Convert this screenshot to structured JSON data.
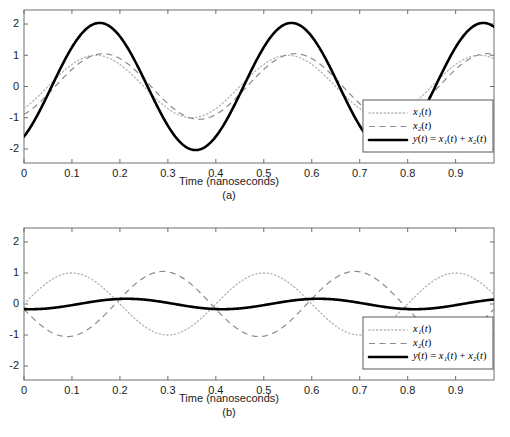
{
  "figure": {
    "panels": [
      {
        "id": "a",
        "caption": "(a)",
        "xlabel": "Time (nanoseconds)",
        "ylabel": "",
        "xticks": [
          "0",
          "0.1",
          "0.2",
          "0.3",
          "0.4",
          "0.5",
          "0.6",
          "0.7",
          "0.8",
          "0.9"
        ],
        "xtick_values": [
          0,
          0.1,
          0.2,
          0.3,
          0.4,
          0.5,
          0.6,
          0.7,
          0.8,
          0.9
        ],
        "yticks": [
          "2",
          "1",
          "0",
          "-1",
          "-2"
        ],
        "ytick_values": [
          2,
          1,
          0,
          -1,
          -2
        ],
        "xlim": [
          0,
          0.98
        ],
        "ylim": [
          -2.45,
          2.45
        ],
        "legend": [
          {
            "label": "x₁(t)",
            "style": "dotted",
            "series": "x1"
          },
          {
            "label": "x₂(t)",
            "style": "dashed",
            "series": "x2"
          },
          {
            "label": "y(t) = x₁(t) + x₂(t)",
            "style": "solid",
            "series": "y"
          }
        ],
        "series": [
          {
            "name": "x1",
            "amplitude": 1.0,
            "period": 0.4,
            "phase_ns": 0.15,
            "offset": 0.0,
            "style": "dotted"
          },
          {
            "name": "x2",
            "amplitude": 1.05,
            "period": 0.4,
            "phase_ns": 0.165,
            "offset": 0.0,
            "style": "dashed"
          },
          {
            "name": "y",
            "amplitude": 0.0,
            "period": 0.4,
            "phase_ns": 0.0,
            "offset": 0.0,
            "style": "solid",
            "is_sum": true
          }
        ]
      },
      {
        "id": "b",
        "caption": "(b)",
        "xlabel": "Time (nanoseconds)",
        "ylabel": "",
        "xticks": [
          "0",
          "0.1",
          "0.2",
          "0.3",
          "0.4",
          "0.5",
          "0.6",
          "0.7",
          "0.8",
          "0.9"
        ],
        "xtick_values": [
          0,
          0.1,
          0.2,
          0.3,
          0.4,
          0.5,
          0.6,
          0.7,
          0.8,
          0.9
        ],
        "yticks": [
          "2",
          "1",
          "0",
          "-1",
          "-2"
        ],
        "ytick_values": [
          2,
          1,
          0,
          -1,
          -2
        ],
        "xlim": [
          0,
          0.98
        ],
        "ylim": [
          -2.45,
          2.45
        ],
        "legend": [
          {
            "label": "x₁(t)",
            "style": "dotted",
            "series": "x1"
          },
          {
            "label": "x₂(t)",
            "style": "dashed",
            "series": "x2"
          },
          {
            "label": "y(t) = x₁(t) + x₂(t)",
            "style": "solid",
            "series": "y"
          }
        ],
        "series": [
          {
            "name": "x1",
            "amplitude": 1.0,
            "period": 0.4,
            "phase_ns": 0.1,
            "offset": 0.0,
            "style": "dotted"
          },
          {
            "name": "x2",
            "amplitude": 1.05,
            "period": 0.4,
            "phase_ns": 0.29,
            "offset": 0.0,
            "style": "dashed"
          },
          {
            "name": "y",
            "amplitude": 0.0,
            "period": 0.4,
            "phase_ns": 0.0,
            "offset": 0.0,
            "style": "solid",
            "is_sum": true
          }
        ]
      }
    ]
  },
  "chart_data": [
    {
      "type": "line",
      "panel": "(a)",
      "title": "",
      "xlabel": "Time (nanoseconds)",
      "ylabel": "",
      "xlim": [
        0,
        0.98
      ],
      "ylim": [
        -2.45,
        2.45
      ],
      "xticks": [
        0,
        0.1,
        0.2,
        0.3,
        0.4,
        0.5,
        0.6,
        0.7,
        0.8,
        0.9
      ],
      "yticks": [
        2,
        1,
        0,
        -1,
        -2
      ],
      "grid": false,
      "legend_position": "lower right",
      "description": "Constructive interference: two nearly in-phase sinusoids sum to roughly double amplitude.",
      "series": [
        {
          "name": "x1(t)",
          "style": "dotted",
          "color": "#b4b4b4",
          "amplitude": 1.0,
          "period_ns": 0.4,
          "peak_times_ns": [
            0.15,
            0.55,
            0.95
          ],
          "x": [
            0,
            0.05,
            0.1,
            0.15,
            0.2,
            0.25,
            0.3,
            0.35,
            0.4,
            0.45,
            0.5,
            0.55,
            0.6,
            0.65,
            0.7,
            0.75,
            0.8,
            0.85,
            0.9,
            0.95
          ],
          "values": [
            -0.0,
            0.707,
            1.0,
            1.0,
            0.707,
            0.0,
            -0.707,
            -1.0,
            -1.0,
            -0.707,
            0.0,
            0.707,
            1.0,
            1.0,
            0.707,
            0.0,
            -0.707,
            -1.0,
            -1.0,
            -0.707
          ]
        },
        {
          "name": "x2(t)",
          "style": "dashed",
          "color": "#8a8a8a",
          "amplitude": 1.05,
          "period_ns": 0.4,
          "peak_times_ns": [
            0.165,
            0.565,
            0.965
          ],
          "x": [
            0,
            0.05,
            0.1,
            0.15,
            0.2,
            0.25,
            0.3,
            0.35,
            0.4,
            0.45,
            0.5,
            0.55,
            0.6,
            0.65,
            0.7,
            0.75,
            0.8,
            0.85,
            0.9,
            0.95
          ],
          "values": [
            -0.26,
            0.52,
            0.97,
            1.04,
            0.81,
            0.16,
            -0.57,
            -0.99,
            -1.03,
            -0.75,
            -0.08,
            0.64,
            1.02,
            1.02,
            0.67,
            -0.08,
            -0.75,
            -1.03,
            -0.99,
            -0.57
          ]
        },
        {
          "name": "y(t) = x1(t) + x2(t)",
          "style": "solid",
          "color": "#000000",
          "amplitude": 1.93,
          "period_ns": 0.4,
          "peak_times_ns": [
            0.125,
            0.525,
            0.925
          ],
          "peak_value": 1.93,
          "trough_value": -1.93,
          "x": [
            0,
            0.05,
            0.1,
            0.15,
            0.2,
            0.25,
            0.3,
            0.35,
            0.4,
            0.45,
            0.5,
            0.55,
            0.6,
            0.65,
            0.7,
            0.75,
            0.8,
            0.85,
            0.9,
            0.95
          ],
          "values": [
            -0.26,
            1.23,
            1.97,
            2.04,
            1.52,
            0.16,
            -1.28,
            -1.99,
            -2.03,
            -1.46,
            -0.08,
            1.35,
            2.02,
            2.02,
            1.38,
            -0.08,
            -1.46,
            -2.03,
            -1.99,
            -1.28
          ]
        }
      ]
    },
    {
      "type": "line",
      "panel": "(b)",
      "title": "",
      "xlabel": "Time (nanoseconds)",
      "ylabel": "",
      "xlim": [
        0,
        0.98
      ],
      "ylim": [
        -2.45,
        2.45
      ],
      "xticks": [
        0,
        0.1,
        0.2,
        0.3,
        0.4,
        0.5,
        0.6,
        0.7,
        0.8,
        0.9
      ],
      "yticks": [
        2,
        1,
        0,
        -1,
        -2
      ],
      "grid": false,
      "legend_position": "lower right",
      "description": "Destructive interference: two nearly anti-phase sinusoids sum to a small residual near zero.",
      "series": [
        {
          "name": "x1(t)",
          "style": "dotted",
          "color": "#b4b4b4",
          "amplitude": 1.0,
          "period_ns": 0.4,
          "peak_times_ns": [
            0.1,
            0.5,
            0.9
          ],
          "x": [
            0,
            0.05,
            0.1,
            0.15,
            0.2,
            0.25,
            0.3,
            0.35,
            0.4,
            0.45,
            0.5,
            0.55,
            0.6,
            0.65,
            0.7,
            0.75,
            0.8,
            0.85,
            0.9,
            0.95
          ],
          "values": [
            0.0,
            0.707,
            1.0,
            0.707,
            0.0,
            -0.707,
            -1.0,
            -0.707,
            0.0,
            0.707,
            1.0,
            0.707,
            0.0,
            -0.707,
            -1.0,
            -0.707,
            0.0,
            0.707,
            1.0,
            0.707
          ]
        },
        {
          "name": "x2(t)",
          "style": "dashed",
          "color": "#8a8a8a",
          "amplitude": 1.05,
          "period_ns": 0.4,
          "peak_times_ns": [
            0.29,
            0.69
          ],
          "x": [
            0,
            0.05,
            0.1,
            0.15,
            0.2,
            0.25,
            0.3,
            0.35,
            0.4,
            0.45,
            0.5,
            0.55,
            0.6,
            0.65,
            0.7,
            0.75,
            0.8,
            0.85,
            0.9,
            0.95
          ],
          "values": [
            -0.21,
            -0.87,
            -1.04,
            -0.62,
            0.12,
            0.81,
            1.05,
            0.78,
            0.06,
            -0.67,
            -1.05,
            -0.86,
            -0.18,
            0.57,
            1.02,
            0.91,
            0.29,
            -0.5,
            -0.99,
            -0.95
          ]
        },
        {
          "name": "y(t) = x1(t) + x2(t)",
          "style": "solid",
          "color": "#000000",
          "amplitude": 0.24,
          "period_ns": 0.4,
          "peak_times_ns": [
            0.19,
            0.59,
            0.99
          ],
          "peak_value": 0.24,
          "trough_value": -0.21,
          "x": [
            0,
            0.05,
            0.1,
            0.15,
            0.2,
            0.25,
            0.3,
            0.35,
            0.4,
            0.45,
            0.5,
            0.55,
            0.6,
            0.65,
            0.7,
            0.75,
            0.8,
            0.85,
            0.9,
            0.95
          ],
          "values": [
            -0.21,
            -0.16,
            -0.04,
            0.09,
            0.2,
            0.24,
            0.2,
            0.09,
            -0.04,
            -0.16,
            -0.21,
            -0.16,
            -0.04,
            0.09,
            0.2,
            0.24,
            0.2,
            0.09,
            -0.04,
            -0.16
          ]
        }
      ]
    }
  ],
  "colors": {
    "x1": "#b4b4b4",
    "x2": "#8a8a8a",
    "y": "#000000",
    "axis": "#6e6e6e",
    "text": "#1b1b1b",
    "background": "#ffffff"
  }
}
